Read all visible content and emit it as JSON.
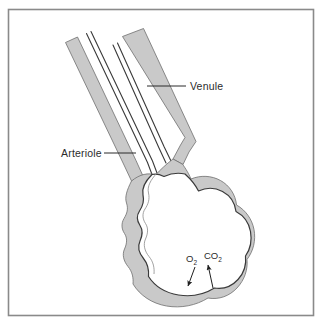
{
  "figure": {
    "frame": {
      "border_color": "#8a8a8a",
      "background_color": "#ffffff"
    },
    "palette": {
      "vessel_wall_fill": "#c9c9c9",
      "vessel_wall_fill_light": "#d8d8d8",
      "outline_color": "#3a3a3a",
      "lumen_fill": "#ffffff",
      "label_color": "#2b2b2b",
      "leader_line_color": "#2b2b2b",
      "arrow_color": "#1f1f1f"
    },
    "labels": [
      {
        "id": "venule",
        "text": "Venule",
        "x": 190,
        "y": 90,
        "leader_from_x": 186,
        "leader_from_y": 86,
        "leader_to_x": 147,
        "leader_to_y": 86
      },
      {
        "id": "arteriole",
        "text": "Arteriole",
        "x": 61,
        "y": 157,
        "leader_from_x": 104,
        "leader_from_y": 153,
        "leader_to_x": 136,
        "leader_to_y": 153
      }
    ],
    "gas_exchange": [
      {
        "id": "oxygen",
        "symbol": "O",
        "subscript": "2",
        "direction": "into-capillary",
        "label_x": 190,
        "label_y": 262,
        "arrow_from_x": 195,
        "arrow_from_y": 266,
        "arrow_to_x": 188,
        "arrow_to_y": 288
      },
      {
        "id": "carbon-dioxide",
        "symbol": "CO",
        "subscript": "2",
        "direction": "out-of-capillary",
        "label_x": 208,
        "label_y": 260,
        "arrow_from_x": 212,
        "arrow_from_y": 288,
        "arrow_to_x": 207,
        "arrow_to_y": 265
      }
    ],
    "vessels": [
      {
        "id": "arteriole-vessel",
        "name": "Arteriole",
        "description": "Arteriole tube descending from upper left into the capillary loop"
      },
      {
        "id": "venule-vessel",
        "name": "Venule",
        "description": "Venule tube descending from top into the capillary loop"
      },
      {
        "id": "capillary-loop",
        "name": "Capillary bed",
        "description": "Lobed capillary loop where gas exchange occurs"
      }
    ]
  }
}
